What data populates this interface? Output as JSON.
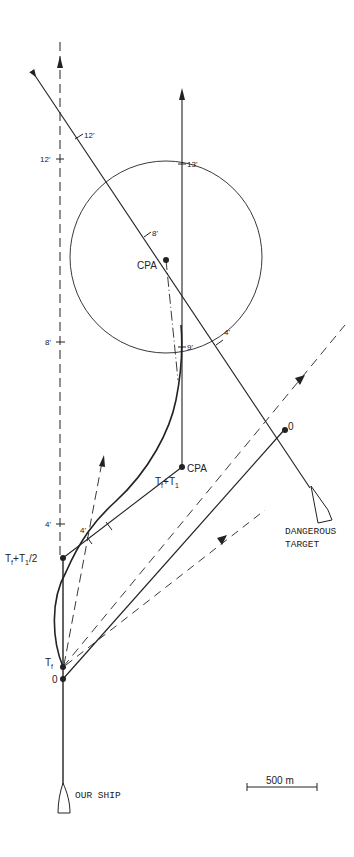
{
  "diagram": {
    "scale_bar": {
      "label": "500 m"
    },
    "own_ship": {
      "label": "OUR SHIP",
      "points": {
        "origin": "0",
        "tf": "T",
        "tf_sub": "f",
        "half": "T",
        "half_sub": "f",
        "half_rest": "+T",
        "half_sub2": "1",
        "half_tail": "/2"
      },
      "ticks": {
        "t4": "4'",
        "t8": "8'",
        "t12": "12'"
      }
    },
    "target": {
      "label_line1": "DANGEROUS",
      "label_line2": "TARGET",
      "origin": "0",
      "ticks": {
        "t4": "4'",
        "t8": "8'",
        "t12": "12'"
      }
    },
    "relative": {
      "cpa_upper": "CPA",
      "cpa_lower": "CPA",
      "ticks": {
        "t9": "9'",
        "t13": "13'"
      },
      "tf_t1": {
        "base": "T",
        "sub1": "f",
        "plus": "+T",
        "sub2": "1"
      }
    },
    "manoeuvre_tick": "4'",
    "colors": {
      "ink": "#222222",
      "background": "#ffffff"
    }
  }
}
